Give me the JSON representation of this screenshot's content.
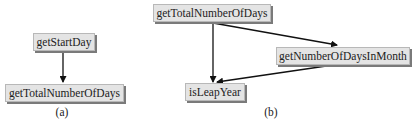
{
  "diagram_a": {
    "caption": "(a)",
    "nodes": [
      {
        "id": "getStartDay",
        "label": "getStartDay"
      },
      {
        "id": "getTotalNumberOfDays",
        "label": "getTotalNumberOfDays"
      }
    ],
    "edges": [
      {
        "from": "getStartDay",
        "to": "getTotalNumberOfDays"
      }
    ]
  },
  "diagram_b": {
    "caption": "(b)",
    "nodes": [
      {
        "id": "getTotalNumberOfDays",
        "label": "getTotalNumberOfDays"
      },
      {
        "id": "getNumberOfDaysInMonth",
        "label": "getNumberOfDaysInMonth"
      },
      {
        "id": "isLeapYear",
        "label": "isLeapYear"
      }
    ],
    "edges": [
      {
        "from": "getTotalNumberOfDays",
        "to": "getNumberOfDaysInMonth"
      },
      {
        "from": "getTotalNumberOfDays",
        "to": "isLeapYear"
      },
      {
        "from": "getNumberOfDaysInMonth",
        "to": "isLeapYear"
      }
    ]
  },
  "colors": {
    "box_fill": "#e4e4e4",
    "box_shadow": "#7a7a7a",
    "arrow": "#111111",
    "text": "#222222"
  }
}
